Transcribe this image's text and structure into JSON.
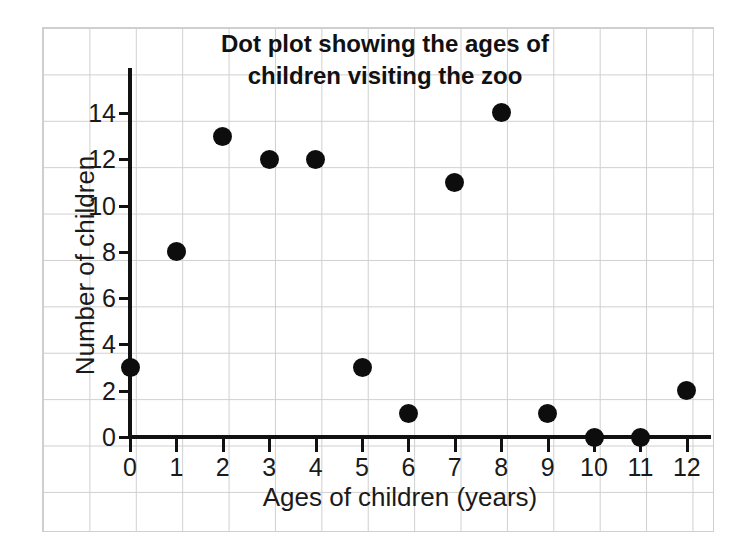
{
  "chart_data": {
    "type": "scatter",
    "title": "Dot plot showing the ages of children visiting the zoo",
    "title_lines": [
      "Dot plot showing the ages of",
      "children visiting the zoo"
    ],
    "xlabel": "Ages of children (years)",
    "ylabel": "Number of children",
    "x": [
      0,
      1,
      2,
      3,
      4,
      5,
      6,
      7,
      8,
      9,
      10,
      11,
      12
    ],
    "values": [
      3,
      8,
      13,
      12,
      12,
      3,
      1,
      11,
      14,
      1,
      0,
      0,
      2
    ],
    "xticks": [
      "0",
      "1",
      "2",
      "3",
      "4",
      "5",
      "6",
      "7",
      "8",
      "9",
      "10",
      "11",
      "12"
    ],
    "yticks": [
      "0",
      "2",
      "4",
      "6",
      "8",
      "10",
      "12",
      "14"
    ],
    "ytick_values": [
      0,
      2,
      4,
      6,
      8,
      10,
      12,
      14
    ],
    "xlim": [
      0,
      12
    ],
    "ylim": [
      0,
      15
    ],
    "grid": true,
    "grid_style": "graph-paper",
    "legend": "none",
    "marker": "filled-circle",
    "marker_color": "#0d0d0d",
    "grid_color": "#cfcfcf",
    "axis_color": "#111111",
    "background": "#ffffff"
  }
}
